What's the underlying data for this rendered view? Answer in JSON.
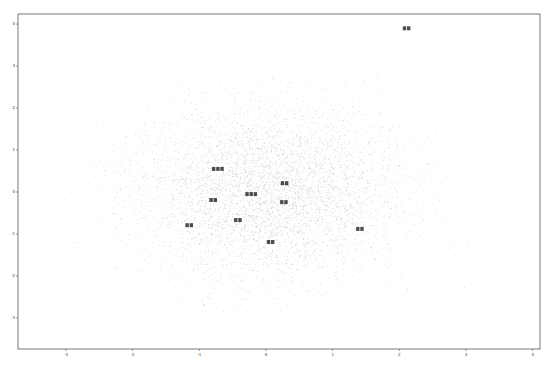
{
  "chart_data": {
    "type": "scatter",
    "title": "",
    "xlabel": "",
    "ylabel": "",
    "xlim": [
      -3.72,
      4.11
    ],
    "ylim": [
      -3.74,
      4.24
    ],
    "grid": false,
    "legend": null,
    "x_ticks": [
      -3,
      -2,
      -1,
      0,
      1,
      2,
      3,
      4
    ],
    "y_ticks": [
      -3,
      -2,
      -1,
      0,
      1,
      2,
      3,
      4
    ],
    "background_cloud": {
      "description": "dense grey random scatter (approx. standard normal distribution) centered near origin",
      "approx_points": 6000,
      "center": [
        0,
        0
      ],
      "std": [
        1.0,
        1.0
      ],
      "color": "#9a9a9a"
    },
    "annotated_points": [
      {
        "label": "???",
        "x": -0.72,
        "y": 0.55,
        "chars": 3
      },
      {
        "label": "??",
        "x": 0.28,
        "y": 0.21,
        "chars": 2
      },
      {
        "label": "???",
        "x": -0.22,
        "y": -0.05,
        "chars": 3
      },
      {
        "label": "??",
        "x": -0.79,
        "y": -0.19,
        "chars": 2
      },
      {
        "label": "??",
        "x": 0.27,
        "y": -0.24,
        "chars": 2
      },
      {
        "label": "??",
        "x": -0.42,
        "y": -0.67,
        "chars": 2
      },
      {
        "label": "??",
        "x": -1.15,
        "y": -0.79,
        "chars": 2
      },
      {
        "label": "??",
        "x": 0.07,
        "y": -1.19,
        "chars": 2
      },
      {
        "label": "??",
        "x": 1.41,
        "y": -0.88,
        "chars": 2
      },
      {
        "label": "??",
        "x": 2.11,
        "y": 3.9,
        "chars": 2
      }
    ],
    "note": "Point labels are CJK text, illegible at screenshot resolution"
  },
  "colors": {
    "frame": "#555555",
    "dots": "#9a9a9a",
    "label": "#111111",
    "background": "#ffffff"
  },
  "layout": {
    "plot_left": 18,
    "plot_top": 14,
    "plot_right": 540,
    "plot_bottom": 349
  }
}
